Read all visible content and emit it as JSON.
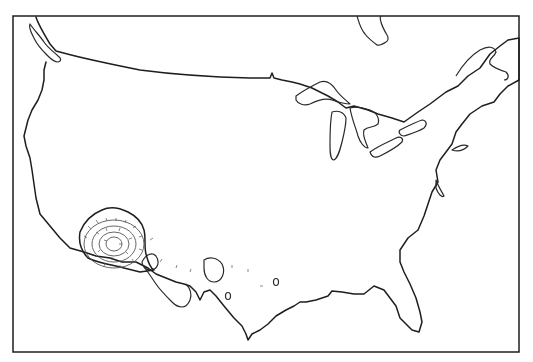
{
  "map": {
    "type": "outline-map",
    "region": "Continental United States",
    "style": "black line drawing on white",
    "colors": {
      "line": "#1e1e1e",
      "background": "#ffffff",
      "contour": "#555555"
    },
    "features": [
      "coastline",
      "great-lakes",
      "vancouver-island",
      "hudson-bay-tip",
      "gulf-of-california",
      "florida-peninsula",
      "hachured-contour-region-southwest"
    ],
    "contour_region": {
      "location": "southwest (Arizona / southern California)",
      "rings": 4,
      "hachures": true
    },
    "text_labels": []
  }
}
